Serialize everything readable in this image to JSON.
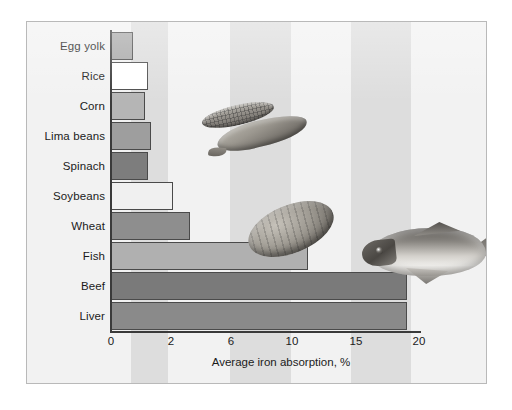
{
  "chart_data": {
    "type": "bar",
    "orientation": "horizontal",
    "title": "",
    "xlabel": "Average iron absorption, %",
    "ylabel": "",
    "categories": [
      "Egg yolk",
      "Rice",
      "Corn",
      "Lima beans",
      "Spinach",
      "Soybeans",
      "Wheat",
      "Fish",
      "Beef",
      "Liver"
    ],
    "values": [
      0.7,
      1.2,
      1.1,
      1.3,
      1.2,
      2.0,
      3.1,
      11.0,
      19.0,
      19.0
    ],
    "xticks": [
      0,
      2,
      6,
      10,
      15,
      20
    ],
    "xtick_labels": [
      "0",
      "2",
      "6",
      "10",
      "15",
      "20"
    ],
    "xlim": [
      0,
      20
    ],
    "axis_scale": "ordinal-nonlinear",
    "grid": false,
    "legend": null,
    "bar_colors": [
      "#a8a8a8",
      "#ffffff",
      "#b5b5b5",
      "#9e9e9e",
      "#7d7d7d",
      "#f0f0f0",
      "#8e8e8e",
      "#b0b0b0",
      "#7a7a7a",
      "#8a8a8a"
    ],
    "bar_border_color": "#4a4a4a",
    "background_color": "#f2f2f2",
    "band_color": "#d9d9d9",
    "axis_color": "#3a3a3a",
    "frame_border_color": "#b9b9b9"
  },
  "figure": {
    "x_axis_title": "Average iron absorption, %",
    "tick_labels": [
      "0",
      "2",
      "6",
      "10",
      "15",
      "20"
    ],
    "category_labels": [
      "Egg yolk",
      "Rice",
      "Corn",
      "Lima beans",
      "Spinach",
      "Soybeans",
      "Wheat",
      "Fish",
      "Beef",
      "Liver"
    ]
  },
  "illustrations": [
    {
      "name": "corn-cob-photo",
      "label": "corn cob"
    },
    {
      "name": "bean-pod-photo",
      "label": "bean pod"
    },
    {
      "name": "soybean-seed-photo",
      "label": "soybean seed"
    },
    {
      "name": "fish-photo",
      "label": "fish"
    }
  ]
}
